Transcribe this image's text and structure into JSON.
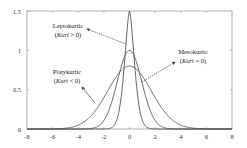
{
  "chart_data": {
    "type": "line",
    "title": "",
    "xlabel": "",
    "ylabel": "",
    "xlim": [
      -8,
      8
    ],
    "ylim": [
      0,
      1.5
    ],
    "grid": false,
    "legend": "none (inline annotations)",
    "x_ticks": [
      "-8",
      "-6",
      "-4",
      "-2",
      "0",
      "2",
      "4",
      "6",
      "8"
    ],
    "y_ticks": [
      "0",
      "0.5",
      "1",
      "1.5"
    ],
    "series": [
      {
        "name": "Leptokurtic (Kurt > 0)",
        "peak": 1.5,
        "center": 0,
        "approx_support": [
          -2,
          2
        ]
      },
      {
        "name": "Mesokurtic (Kurt = 0)",
        "peak": 1.0,
        "center": 0,
        "approx_support": [
          -3.5,
          3.5
        ]
      },
      {
        "name": "Platykurtic (Kurt < 0)",
        "peak": 0.8,
        "center": 0,
        "approx_support": [
          -7,
          7
        ]
      }
    ],
    "annotations": [
      {
        "label": "Leptokurtic",
        "sub": "(Kurt > 0)"
      },
      {
        "label": "Mesokurtic",
        "sub": "(Kurt = 0)"
      },
      {
        "label": "Platykurtic",
        "sub": "(Kurt < 0)"
      }
    ]
  },
  "labels": {
    "lepto_name": "Leptokurtic",
    "lepto_open": "(",
    "lepto_kurt": "Kurt",
    "lepto_rest": " > 0)",
    "meso_name": "Mesokurtic",
    "meso_open": "(",
    "meso_kurt": "Kurt",
    "meso_rest": " = 0)",
    "platy_name": "Platykurtic",
    "platy_open": "(",
    "platy_kurt": "Kurt",
    "platy_rest": " < 0)"
  },
  "axes": {
    "x": [
      "-8",
      "-6",
      "-4",
      "-2",
      "0",
      "2",
      "4",
      "6",
      "8"
    ],
    "y": [
      "0",
      "0.5",
      "1",
      "1.5"
    ]
  }
}
